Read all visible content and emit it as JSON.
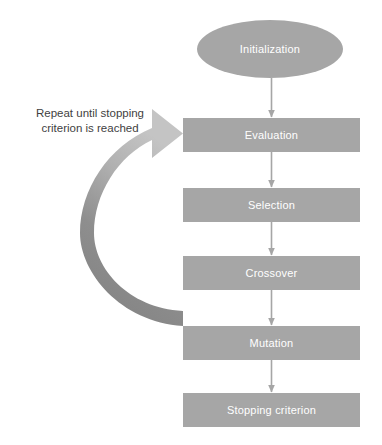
{
  "diagram": {
    "background_color": "#ffffff",
    "shape_fill_color": "#a6a6a6",
    "shape_text_color": "#ffffff",
    "connector_color": "#a6a6a6",
    "loop_arrow_color_light": "#bfbfbf",
    "loop_arrow_color_dark": "#808080",
    "caption_text_color": "#3f3f3f",
    "nodes": [
      {
        "id": "initialization",
        "label": "Initialization",
        "shape": "ellipse",
        "x": 197,
        "y": 20,
        "width": 146,
        "height": 58
      },
      {
        "id": "evaluation",
        "label": "Evaluation",
        "shape": "rectangle",
        "x": 183,
        "y": 118,
        "width": 177,
        "height": 34
      },
      {
        "id": "selection",
        "label": "Selection",
        "shape": "rectangle",
        "x": 183,
        "y": 188,
        "width": 177,
        "height": 34
      },
      {
        "id": "crossover",
        "label": "Crossover",
        "shape": "rectangle",
        "x": 183,
        "y": 256,
        "width": 177,
        "height": 34
      },
      {
        "id": "mutation",
        "label": "Mutation",
        "shape": "rectangle",
        "x": 183,
        "y": 326,
        "width": 177,
        "height": 34
      },
      {
        "id": "stopping-criterion",
        "label": "Stopping criterion",
        "shape": "rectangle",
        "x": 183,
        "y": 393,
        "width": 177,
        "height": 34
      }
    ],
    "connectors": [
      {
        "id": "initialization-to-evaluation",
        "from": "initialization",
        "to": "evaluation"
      },
      {
        "id": "evaluation-to-selection",
        "from": "evaluation",
        "to": "selection"
      },
      {
        "id": "selection-to-crossover",
        "from": "selection",
        "to": "crossover"
      },
      {
        "id": "crossover-to-mutation",
        "from": "crossover",
        "to": "mutation"
      },
      {
        "id": "mutation-to-stopping-criterion",
        "from": "mutation",
        "to": "stopping-criterion"
      }
    ],
    "loop": {
      "id": "feedback-loop",
      "from": "mutation",
      "to": "evaluation",
      "caption": "Repeat until stopping\ncriterion is reached"
    }
  }
}
